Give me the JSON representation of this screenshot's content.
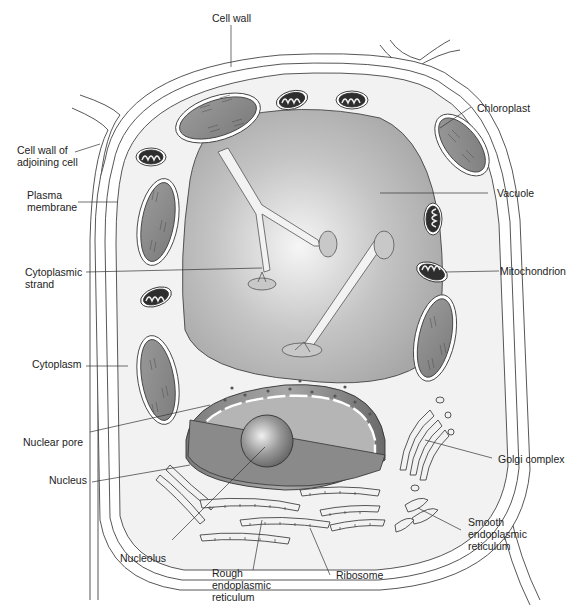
{
  "diagram": {
    "labels": {
      "cell_wall": "Cell wall",
      "cell_wall_adjoining": "Cell wall of\nadjoining cell",
      "plasma_membrane": "Plasma\nmembrane",
      "cytoplasmic_strand": "Cytoplasmic\nstrand",
      "cytoplasm": "Cytoplasm",
      "nuclear_pore": "Nuclear pore",
      "nucleus": "Nucleus",
      "nucleolus": "Nucleolus",
      "rough_er": "Rough\nendoplasmic\nreticulum",
      "ribosome": "Ribosome",
      "smooth_er": "Smooth\nendoplasmic\nreticulum",
      "golgi_complex": "Golgi complex",
      "mitochondrion": "Mitochondrion",
      "vacuole": "Vacuole",
      "chloroplast": "Chloroplast"
    },
    "colors": {
      "cytoplasm_fill": "#f2f2f2",
      "vacuole_fill": "#b3b3b3",
      "vacuole_highlight": "#f4f4f4",
      "organelle_fill": "#8e8e8e",
      "mitochondria_dark": "#2e2e2e",
      "nucleus_fill": "#8a8a8a",
      "outline": "#333333"
    }
  }
}
